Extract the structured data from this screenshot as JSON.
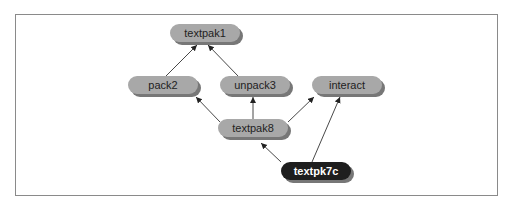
{
  "diagram": {
    "type": "dependency-graph",
    "nodes": [
      {
        "id": "textpak1",
        "label": "textpak1",
        "style": "normal"
      },
      {
        "id": "pack2",
        "label": "pack2",
        "style": "normal"
      },
      {
        "id": "unpack3",
        "label": "unpack3",
        "style": "normal"
      },
      {
        "id": "interact",
        "label": "interact",
        "style": "normal"
      },
      {
        "id": "textpak8",
        "label": "textpak8",
        "style": "normal"
      },
      {
        "id": "textpk7c",
        "label": "textpk7c",
        "style": "highlighted"
      }
    ],
    "edges": [
      {
        "from": "pack2",
        "to": "textpak1"
      },
      {
        "from": "unpack3",
        "to": "textpak1"
      },
      {
        "from": "textpak8",
        "to": "pack2"
      },
      {
        "from": "textpak8",
        "to": "unpack3"
      },
      {
        "from": "textpak8",
        "to": "interact"
      },
      {
        "from": "textpk7c",
        "to": "textpak8"
      },
      {
        "from": "textpk7c",
        "to": "interact"
      }
    ],
    "colors": {
      "node_fill": "#a8a8a8",
      "node_shadow": "#4a4a4a",
      "highlight_fill": "#1e1e1e",
      "highlight_text": "#ffffff",
      "text": "#222222",
      "edge": "#333333",
      "frame": "#8a8a8a"
    }
  }
}
